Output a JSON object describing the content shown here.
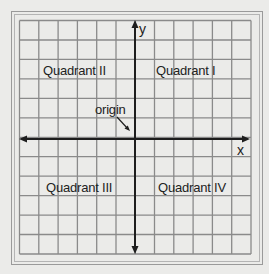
{
  "diagram": {
    "type": "coordinate-plane",
    "grid": {
      "columns": 12,
      "rows": 12,
      "line_color": "#8a8a8a",
      "axis_color": "#1e1e1e",
      "background": "#ececea"
    },
    "axes": {
      "x_label": "x",
      "y_label": "y"
    },
    "quadrants": {
      "q1": "Quadrant I",
      "q2": "Quadrant II",
      "q3": "Quadrant III",
      "q4": "Quadrant IV"
    },
    "annotations": {
      "origin": "origin"
    }
  }
}
